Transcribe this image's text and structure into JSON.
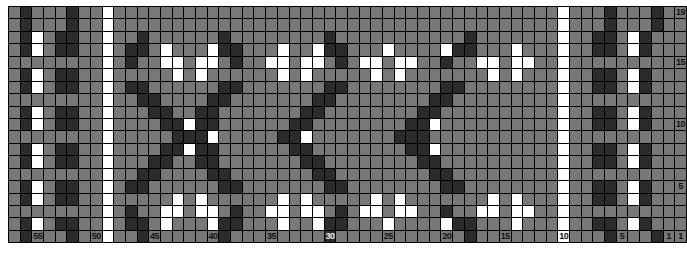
{
  "chart_title": "Fair Isle / Selbu Star Colorwork Chart",
  "palette": {
    "dark": "#2b2b2b",
    "gray": "#787878",
    "white": "#ffffff",
    "gridline": "#000000"
  },
  "legend": {
    "dark_label": "dark",
    "gray_label": "gray",
    "white_label": "white"
  },
  "axes": {
    "columns_total": 57,
    "rows_total": 19,
    "column_direction": "right-to-left",
    "row_direction": "bottom-to-top",
    "column_tick_labels": [
      "55",
      "50",
      "45",
      "40",
      "35",
      "30",
      "25",
      "20",
      "15",
      "10",
      "5",
      "1"
    ],
    "column_tick_positions": [
      55,
      50,
      45,
      40,
      35,
      30,
      25,
      20,
      15,
      10,
      5,
      1
    ],
    "row_tick_labels": [
      "19",
      "15",
      "10",
      "5",
      "1"
    ],
    "row_tick_positions": [
      19,
      15,
      10,
      5,
      1
    ]
  },
  "chart_data": {
    "type": "heatmap",
    "xlabel": "",
    "ylabel": "",
    "grid": true,
    "legend_position": "none",
    "colors": [
      "#2b2b2b",
      "#787878",
      "#ffffff"
    ],
    "color_keys": [
      "D",
      "G",
      "W"
    ],
    "x": [
      57,
      56,
      55,
      54,
      53,
      52,
      51,
      50,
      49,
      48,
      47,
      46,
      45,
      44,
      43,
      42,
      41,
      40,
      39,
      38,
      37,
      36,
      35,
      34,
      33,
      32,
      31,
      30,
      29,
      28,
      27,
      26,
      25,
      24,
      23,
      22,
      21,
      20,
      19,
      18,
      17,
      16,
      15,
      14,
      13,
      12,
      11,
      10,
      9,
      8,
      7,
      6,
      5,
      4,
      3,
      2,
      1
    ],
    "y": [
      19,
      18,
      17,
      16,
      15,
      14,
      13,
      12,
      11,
      10,
      9,
      8,
      7,
      6,
      5,
      4,
      3,
      2,
      1
    ],
    "rows": [
      {
        "row": 19,
        "cells": "GDGGGDGGWGGGGGGGGGGGGGGGGGGGGGGGGGGGGGGGGGGGGGGWGGGDGGGD"
      },
      {
        "row": 18,
        "cells": "GDGGGDGGWGGGGGGGGGGGGGGGGGGGGGGGGGGGGGGGGGGGGGGWGGGDGGGD"
      },
      {
        "row": 17,
        "cells": "GDWGDDGGWGGDGGGGGGDGGGGGGGGDGGGGGGGGGGGDGGGGGGGWGGDDGWDG"
      },
      {
        "row": 16,
        "cells": "GDWGDDGGWGDDGWGGGWDDGGGWGGWDDGGGWGGGGWDDGGGWGGGWGGDDGWDG"
      },
      {
        "row": 15,
        "cells": "GGGGGGGGWGDGGWWGWWGDGGWWGWWGDGWWGWWGGDGGWWGWWGGWGGGGGGGG"
      },
      {
        "row": 14,
        "cells": "GDWGDDGGWGGGGGWGWGGGGGGWGWGGGGGWGWGGGGGGGWGWGGGWGGDDGWDG"
      },
      {
        "row": 13,
        "cells": "GDWGDDGGWGDDGGGGGGDDGGGGGGGDDGGGGGGGGDDGGGGGGGGWGGDDGWDG"
      },
      {
        "row": 12,
        "cells": "GGGGGGGGWGGDDGGGGDDGGGGGGGDDGGGGGGGGDDGGGGGGGGGWGGGGGGGG"
      },
      {
        "row": 11,
        "cells": "GDWGDDGGWGGGDDGGDDGGGGGGGDDGGGGGGGGDDGGGGGGGGGGWGGDDGWDG"
      },
      {
        "row": 10,
        "cells": "GDWGDDGGWGGGGDDWDDGGGGGGDDGGGGGGGGDDWGGGGGGGGGGWGGDDGWDG"
      },
      {
        "row": 9,
        "cells": "GGGGGGGGWGGGGGDDDWGGGGGDDWGGGGGGGDDDGGGGGGGGGGGWGGGGGGGG"
      },
      {
        "row": 8,
        "cells": "GDWGDDGGWGGGGDDWDDGGGGGGDDGGGGGGGGDDWGGGGGGGGGGWGGDDGWDG"
      },
      {
        "row": 7,
        "cells": "GDWGDDGGWGGGDDGGDDGGGGGGGDDGGGGGGGGDDGGGGGGGGGGWGGDDGWDG"
      },
      {
        "row": 6,
        "cells": "GGGGGGGGWGGDDGGGGDDGGGGGGGDDGGGGGGGGDDGGGGGGGGGWGGGGGGGG"
      },
      {
        "row": 5,
        "cells": "GDWGDDGGWGDDGGGGGGDDGGGGGGGDDGGGGGGGGDDGGGGGGGGWGGDDGWDG"
      },
      {
        "row": 4,
        "cells": "GDWGDDGGWGGGGGWGWGGGGGGWGWGGGGGWGWGGGGGGGWGWGGGWGGDDGWDG"
      },
      {
        "row": 3,
        "cells": "GGGGGGGGWGDGGWWGWWGDGGWWGWWGDGWWGWWGGDGGWWGWWGGWGGGGGGGG"
      },
      {
        "row": 2,
        "cells": "GDWGDDGGWGDDGWGGGWDDGGGWGGWDDGGGWGGGGWDDGGGWGGGWGGDDGWDG"
      },
      {
        "row": 1,
        "cells": "GDGGGDGGWGGDGGGGGGDGGGGGGGGDGGGGGGGGGGGDGGGGGGGWGGGDGGGD"
      }
    ],
    "motifs": [
      {
        "name": "left-border-panel",
        "columns": [
          57,
          50
        ]
      },
      {
        "name": "left-separator-column",
        "columns": [
          49
        ]
      },
      {
        "name": "dark-eight-pointed-star",
        "columns": [
          48,
          30
        ]
      },
      {
        "name": "white-eight-pointed-star",
        "columns": [
          29,
          11
        ]
      },
      {
        "name": "right-separator-column",
        "columns": [
          10
        ]
      },
      {
        "name": "right-border-panel",
        "columns": [
          9,
          1
        ]
      }
    ]
  }
}
